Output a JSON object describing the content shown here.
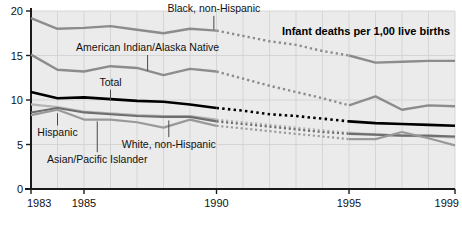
{
  "chart_data": {
    "type": "line",
    "title": "Infant deaths per 1,00 live births",
    "xlabel": "",
    "ylabel": "",
    "xlim": [
      1983,
      1999
    ],
    "ylim": [
      0,
      20
    ],
    "yticks": [
      0,
      5,
      10,
      15,
      20
    ],
    "ytick_labels": [
      "0",
      "5",
      "10",
      "15",
      "20"
    ],
    "xticks": [
      1983,
      1985,
      1990,
      1995,
      1999
    ],
    "xtick_labels": [
      "1983",
      "1985",
      "1990",
      "1995",
      "1999"
    ],
    "grid": true,
    "grid_x_every_year": true,
    "legend": "inline-annotations",
    "note": "Segments from 1991 to 1994 are drawn as dotted interpolations",
    "x": [
      1983,
      1984,
      1985,
      1986,
      1987,
      1988,
      1989,
      1990,
      1991,
      1992,
      1993,
      1994,
      1995,
      1996,
      1997,
      1998,
      1999
    ],
    "series": [
      {
        "name": "Black, non-Hispanic",
        "color": "#8c8c8c",
        "width": 2.4,
        "solid_ranges": [
          [
            1983,
            1990
          ],
          [
            1995,
            1999
          ]
        ],
        "dotted_ranges": [
          [
            1990,
            1995
          ]
        ],
        "values": [
          19.2,
          18.0,
          18.1,
          18.3,
          17.9,
          17.5,
          18.0,
          17.8,
          17.2,
          16.6,
          16.2,
          15.5,
          15.0,
          14.2,
          14.3,
          14.4,
          14.4
        ]
      },
      {
        "name": "American Indian/Alaska Native",
        "color": "#8c8c8c",
        "width": 2.4,
        "solid_ranges": [
          [
            1983,
            1990
          ],
          [
            1995,
            1999
          ]
        ],
        "dotted_ranges": [
          [
            1990,
            1995
          ]
        ],
        "values": [
          15.1,
          13.4,
          13.2,
          13.8,
          13.6,
          12.8,
          13.5,
          13.2,
          12.4,
          11.6,
          10.9,
          10.2,
          9.4,
          10.4,
          8.9,
          9.4,
          9.3
        ]
      },
      {
        "name": "Total",
        "color": "#000000",
        "width": 2.6,
        "solid_ranges": [
          [
            1983,
            1990
          ],
          [
            1995,
            1999
          ]
        ],
        "dotted_ranges": [
          [
            1990,
            1995
          ]
        ],
        "values": [
          10.9,
          10.2,
          10.3,
          10.1,
          9.9,
          9.8,
          9.5,
          9.1,
          8.8,
          8.4,
          8.2,
          7.9,
          7.6,
          7.4,
          7.3,
          7.2,
          7.1
        ]
      },
      {
        "name": "Hispanic",
        "color": "#b5b5b5",
        "width": 2.2,
        "solid_ranges": [
          [
            1983,
            1990
          ],
          [
            1995,
            1999
          ]
        ],
        "dotted_ranges": [
          [
            1990,
            1995
          ]
        ],
        "values": [
          9.5,
          9.2,
          8.7,
          8.5,
          8.3,
          8.2,
          8.2,
          7.8,
          7.5,
          7.2,
          6.9,
          6.6,
          6.3,
          6.1,
          6.0,
          5.9,
          5.8
        ]
      },
      {
        "name": "White, non-Hispanic",
        "color": "#6e6e6e",
        "width": 2.2,
        "solid_ranges": [
          [
            1983,
            1990
          ],
          [
            1995,
            1999
          ]
        ],
        "dotted_ranges": [
          [
            1990,
            1995
          ]
        ],
        "values": [
          8.6,
          9.1,
          8.6,
          8.4,
          8.2,
          8.1,
          8.1,
          7.6,
          7.3,
          7.0,
          6.7,
          6.4,
          6.2,
          6.1,
          6.0,
          6.0,
          5.9
        ]
      },
      {
        "name": "Asian/Pacific Islander",
        "color": "#999999",
        "width": 2.2,
        "solid_ranges": [
          [
            1983,
            1990
          ],
          [
            1995,
            1999
          ]
        ],
        "dotted_ranges": [
          [
            1990,
            1995
          ]
        ],
        "values": [
          8.3,
          8.9,
          7.8,
          7.8,
          7.5,
          6.9,
          7.8,
          7.1,
          6.8,
          6.5,
          6.2,
          5.9,
          5.6,
          5.6,
          6.4,
          5.7,
          4.9
        ]
      }
    ],
    "annotations": [
      {
        "id": "black-non-hispanic",
        "text": "Black, non-Hispanic",
        "x": 1989.9,
        "y": 19.9,
        "anchor": "middle",
        "leader_to_y": 17.9
      },
      {
        "id": "american-indian-alaska-native",
        "text": "American Indian/Alaska Native",
        "x": 1987.4,
        "y": 15.5,
        "anchor": "middle",
        "leader_to_y": 13.3
      },
      {
        "id": "total",
        "text": "Total",
        "x": 1986.0,
        "y": 11.6,
        "anchor": "middle",
        "leader_to_y": 9.9
      },
      {
        "id": "hispanic",
        "text": "Hispanic",
        "x": 1984.0,
        "y": 5.9,
        "anchor": "middle",
        "leader_to_y": 8.5
      },
      {
        "id": "white-non-hispanic",
        "text": "White, non-Hispanic",
        "x": 1988.2,
        "y": 4.6,
        "anchor": "middle",
        "leader_to_y": 7.7
      },
      {
        "id": "asian-pacific-islander",
        "text": "Asian/Pacific Islander",
        "x": 1985.5,
        "y": 2.9,
        "anchor": "middle",
        "leader_to_y": 7.6
      }
    ]
  },
  "colors": {
    "plot_background": "#ebebeb",
    "grid": "#d2d2d2",
    "axis": "#1a1a1a",
    "page_background": "#ffffff",
    "title": "#000000"
  }
}
